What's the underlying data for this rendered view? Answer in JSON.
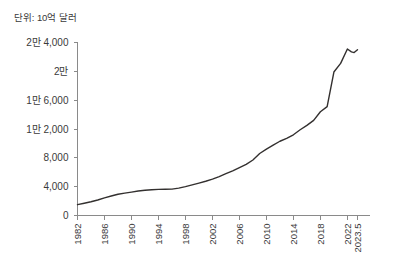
{
  "unit_label": "단위: 10억 달러",
  "chart_data": {
    "type": "line",
    "title": "",
    "subtitle": "",
    "xlabel": "",
    "ylabel": "단위: 10억 달러",
    "grid": false,
    "legend": null,
    "xlim": [
      1982,
      2023.5
    ],
    "ylim": [
      0,
      24000
    ],
    "ytick_labels": [
      "2만 4,000",
      "2만",
      "1만 6,000",
      "1만 2,000",
      "8,000",
      "4,000",
      "0"
    ],
    "ytick_values": [
      24000,
      20000,
      16000,
      12000,
      8000,
      4000,
      0
    ],
    "xtick_labels": [
      "1982",
      "1986",
      "1990",
      "1994",
      "1998",
      "2002",
      "2006",
      "2010",
      "2014",
      "2018",
      "2022",
      "2023.5"
    ],
    "xtick_values": [
      1982,
      1986,
      1990,
      1994,
      1998,
      2002,
      2006,
      2010,
      2014,
      2018,
      2022,
      2023.5
    ],
    "line_color": "#33302f",
    "axis_color": "#8a8a8a",
    "series": [
      {
        "name": "미국 국가부채",
        "x": [
          1982,
          1983,
          1984,
          1985,
          1986,
          1987,
          1988,
          1989,
          1990,
          1991,
          1992,
          1993,
          1994,
          1995,
          1996,
          1997,
          1998,
          1999,
          2000,
          2001,
          2002,
          2003,
          2004,
          2005,
          2006,
          2007,
          2008,
          2009,
          2010,
          2011,
          2012,
          2013,
          2014,
          2015,
          2016,
          2017,
          2018,
          2019,
          2020,
          2021,
          2022,
          2022.6,
          2023,
          2023.5
        ],
        "values": [
          1500,
          1700,
          1900,
          2150,
          2450,
          2700,
          2950,
          3100,
          3250,
          3400,
          3500,
          3580,
          3620,
          3640,
          3660,
          3800,
          4000,
          4250,
          4500,
          4750,
          5050,
          5400,
          5800,
          6200,
          6650,
          7100,
          7700,
          8600,
          9200,
          9750,
          10300,
          10700,
          11200,
          11900,
          12500,
          13200,
          14400,
          15100,
          19900,
          21100,
          23100,
          22700,
          22600,
          23000
        ]
      }
    ],
    "annotations": []
  }
}
